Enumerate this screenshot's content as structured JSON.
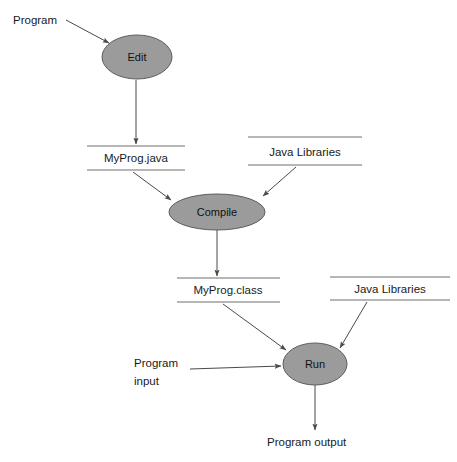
{
  "diagram": {
    "colors": {
      "node_fill": "#9b9b9b",
      "node_stroke": "#5d5d5d",
      "edge": "#4a4a4a",
      "rule": "#6e6e6e",
      "background": "#ffffff",
      "text": "#1a1a1a"
    },
    "process_nodes": [
      {
        "id": "edit",
        "label": "Edit",
        "cx": 137,
        "cy": 57,
        "rx": 35,
        "ry": 22
      },
      {
        "id": "compile",
        "label": "Compile",
        "cx": 217,
        "cy": 212,
        "rx": 48,
        "ry": 18
      },
      {
        "id": "run",
        "label": "Run",
        "cx": 315,
        "cy": 364,
        "rx": 32,
        "ry": 21
      }
    ],
    "artifacts": [
      {
        "id": "myprog-java",
        "label": "MyProg.java",
        "cx": 136,
        "top_y": 146,
        "bottom_y": 170,
        "x1": 87,
        "x2": 185,
        "text_y": 159
      },
      {
        "id": "java-libraries-compile",
        "label": "Java Libraries",
        "cx": 305,
        "top_y": 137,
        "bottom_y": 165,
        "x1": 248,
        "x2": 362,
        "text_y": 153
      },
      {
        "id": "myprog-class",
        "label": "MyProg.class",
        "cx": 228,
        "top_y": 278,
        "bottom_y": 302,
        "x1": 177,
        "x2": 280,
        "text_y": 291
      },
      {
        "id": "java-libraries-run",
        "label": "Java Libraries",
        "cx": 390,
        "top_y": 277,
        "bottom_y": 300,
        "x1": 330,
        "x2": 450,
        "text_y": 290
      }
    ],
    "free_labels": [
      {
        "id": "program-source",
        "label": "Program",
        "x": 13,
        "y": 24
      },
      {
        "id": "program-input-line1",
        "label": "Program",
        "x": 134,
        "y": 367
      },
      {
        "id": "program-input-line2",
        "label": "input",
        "x": 134,
        "y": 385
      },
      {
        "id": "program-output",
        "label": "Program output",
        "x": 267,
        "y": 446
      }
    ],
    "edges": [
      {
        "id": "program-to-edit",
        "from": "Program",
        "to": "Edit"
      },
      {
        "id": "edit-to-myprog-java",
        "from": "Edit",
        "to": "MyProg.java"
      },
      {
        "id": "myprog-java-to-compile",
        "from": "MyProg.java",
        "to": "Compile"
      },
      {
        "id": "java-libraries-to-compile",
        "from": "Java Libraries",
        "to": "Compile"
      },
      {
        "id": "compile-to-myprog-class",
        "from": "Compile",
        "to": "MyProg.class"
      },
      {
        "id": "myprog-class-to-run",
        "from": "MyProg.class",
        "to": "Run"
      },
      {
        "id": "java-libraries-to-run",
        "from": "Java Libraries",
        "to": "Run"
      },
      {
        "id": "program-input-to-run",
        "from": "Program input",
        "to": "Run"
      },
      {
        "id": "run-to-program-output",
        "from": "Run",
        "to": "Program output"
      }
    ]
  }
}
